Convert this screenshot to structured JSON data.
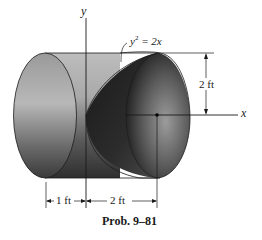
{
  "figure": {
    "caption": "Prob. 9–81",
    "axes": {
      "y_label": "y",
      "x_label": "x"
    },
    "curve_label": {
      "lhs": "y",
      "exp": "2",
      "rhs": " = 2x"
    },
    "dimensions": {
      "radius": "2 ft",
      "left_length": "1 ft",
      "right_length": "2 ft"
    },
    "colors": {
      "solid_light": "#c8c8c8",
      "solid_mid": "#8a8a8a",
      "solid_dark": "#2a2a2a",
      "line": "#1a1a1a",
      "background": "#ffffff"
    }
  }
}
